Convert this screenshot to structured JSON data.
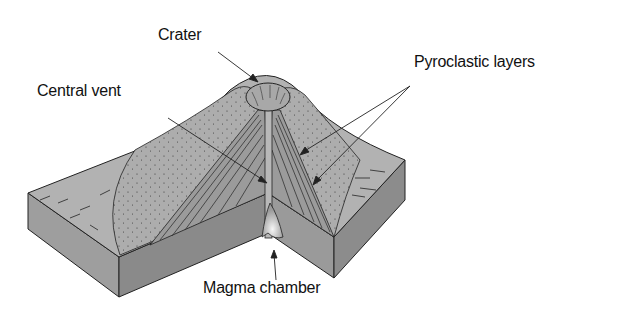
{
  "diagram": {
    "labels": {
      "crater": "Crater",
      "central_vent": "Central vent",
      "pyroclastic_layers": "Pyroclastic layers",
      "magma_chamber": "Magma chamber"
    },
    "colors": {
      "background": "#ffffff",
      "surface": "#b4b4b4",
      "cone_speckled": "#aaaaaa",
      "block_side_dark": "#8a8a8a",
      "block_side_light": "#a0a0a0",
      "layers": "#9a9a9a",
      "magma_glow": "#e8e8e8",
      "outline": "#222222"
    }
  }
}
